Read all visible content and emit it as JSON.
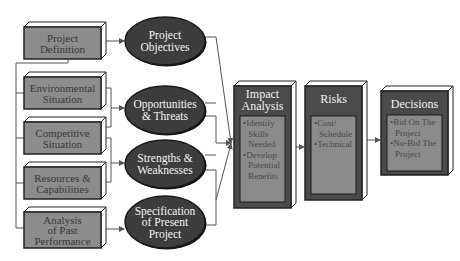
{
  "inputs": [
    {
      "id": "project-definition",
      "lines": [
        "Project",
        "Definition"
      ]
    },
    {
      "id": "environmental-situation",
      "lines": [
        "Environmental",
        "Situation"
      ]
    },
    {
      "id": "competitive-situation",
      "lines": [
        "Competitive",
        "Situation"
      ]
    },
    {
      "id": "resources-capabilities",
      "lines": [
        "Resources &",
        "Capabilities"
      ]
    },
    {
      "id": "analysis-past-performance",
      "lines": [
        "Analysis",
        "of Past",
        "Performance"
      ]
    }
  ],
  "outputs": [
    {
      "id": "project-objectives",
      "lines": [
        "Project",
        "Objectives"
      ]
    },
    {
      "id": "opportunities-threats",
      "lines": [
        "Opportunities",
        "& Threats"
      ]
    },
    {
      "id": "strengths-weaknesses",
      "lines": [
        "Strengths &",
        "Weaknesses"
      ]
    },
    {
      "id": "specification-present-project",
      "lines": [
        "Specification",
        "of Present",
        "Project"
      ]
    }
  ],
  "stages": [
    {
      "id": "impact-analysis",
      "title": [
        "Impact",
        "Analysis"
      ],
      "bullets": [
        [
          "Identify",
          "Skills",
          "Needed"
        ],
        [
          "Develop",
          "Potential",
          "Benefits"
        ]
      ]
    },
    {
      "id": "risks",
      "title": [
        "Risks"
      ],
      "bullets": [
        [
          "Cost/",
          "Schedule"
        ],
        [
          "Technical"
        ]
      ]
    },
    {
      "id": "decisions",
      "title": [
        "Decisions"
      ],
      "bullets": [
        [
          "Bid On The",
          "Project"
        ],
        [
          "No-Bid The",
          "Project"
        ]
      ]
    }
  ],
  "colors": {
    "input_fill": "#8c8c8c",
    "oval_fill": "#3d3d3d",
    "stage_fill": "#4a4a4a",
    "stage_inner": "#8a8a8a",
    "line": "#555555",
    "bevel": "#ffffff"
  }
}
